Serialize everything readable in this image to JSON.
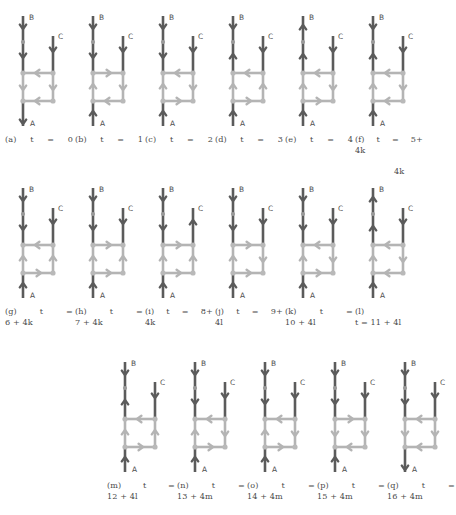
{
  "figure": {
    "colors": {
      "dark_edge": "#5b5b5b",
      "light_edge": "#b4b4b4",
      "node": "#b9b9b9",
      "node_dark": "#9a9a9a",
      "text": "#4a4a4a",
      "background": "#ffffff"
    },
    "node_labels": {
      "a": "A",
      "b": "B",
      "c": "C"
    },
    "rows": [
      {
        "id": "row-1",
        "panels": [
          {
            "key": "a",
            "label": "(a)",
            "time": "t = 0",
            "caption_lines": [
              "(a) t = 0"
            ],
            "tail": "",
            "arrows": {
              "b_top": "down",
              "b_mid": "down",
              "c_top": "down",
              "rung_top": "left",
              "rail_left": "down",
              "rail_right": "down",
              "rung_bottom": "left",
              "a_bottom": "down"
            }
          },
          {
            "key": "b",
            "label": "(b)",
            "time": "t = 1",
            "caption_lines": [
              "(b) t = 1"
            ],
            "tail": "",
            "arrows": {
              "b_top": "down",
              "b_mid": "down",
              "c_top": "down",
              "rung_top": "right",
              "rail_left": "up",
              "rail_right": "down",
              "rung_bottom": "left",
              "a_bottom": "up"
            }
          },
          {
            "key": "c",
            "label": "(c)",
            "time": "t = 2",
            "caption_lines": [
              "(c) t = 2"
            ],
            "tail": "",
            "arrows": {
              "b_top": "down",
              "b_mid": "down",
              "c_top": "down",
              "rung_top": "left",
              "rail_left": "up",
              "rail_right": "down",
              "rung_bottom": "right",
              "a_bottom": "up"
            }
          },
          {
            "key": "d",
            "label": "(d)",
            "time": "t = 3",
            "caption_lines": [
              "(d) t = 3"
            ],
            "tail": "",
            "arrows": {
              "b_top": "down",
              "b_mid": "up",
              "c_top": "down",
              "rung_top": "left",
              "rail_left": "up",
              "rail_right": "up",
              "rung_bottom": "right",
              "a_bottom": "up"
            }
          },
          {
            "key": "e",
            "label": "(e)",
            "time": "t = 4",
            "caption_lines": [
              "(e) t = 4"
            ],
            "tail": "",
            "arrows": {
              "b_top": "up",
              "b_mid": "up",
              "c_top": "down",
              "rung_top": "left",
              "rail_left": "up",
              "rail_right": "down",
              "rung_bottom": "right",
              "a_bottom": "up"
            }
          },
          {
            "key": "f",
            "label": "(f)",
            "time": "t = 5+",
            "caption_lines": [
              "(f) t = 5+"
            ],
            "tail": "4k",
            "arrows": {
              "b_top": "down",
              "b_mid": "up",
              "c_top": "down",
              "rung_top": "left",
              "rail_left": "up",
              "rail_right": "down",
              "rung_bottom": "left",
              "a_bottom": "up"
            }
          }
        ]
      },
      {
        "id": "row-2",
        "panels": [
          {
            "key": "g",
            "label": "(g)",
            "time": "t =",
            "caption_lines": [
              "(g) t ="
            ],
            "tail": "6 + 4k",
            "arrows": {
              "b_top": "down",
              "b_mid": "down",
              "c_top": "down",
              "rung_top": "left",
              "rail_left": "up",
              "rail_right": "up",
              "rung_bottom": "right",
              "a_bottom": "up"
            }
          },
          {
            "key": "h",
            "label": "(h)",
            "time": "t =",
            "caption_lines": [
              "(h) t ="
            ],
            "tail": "7 + 4k",
            "arrows": {
              "b_top": "down",
              "b_mid": "down",
              "c_top": "down",
              "rung_top": "right",
              "rail_left": "up",
              "rail_right": "up",
              "rung_bottom": "right",
              "a_bottom": "up"
            }
          },
          {
            "key": "i",
            "label": "(i)",
            "time": "t = 8+",
            "caption_lines": [
              "(i) t = 8+"
            ],
            "tail": "4k",
            "arrows": {
              "b_top": "down",
              "b_mid": "down",
              "c_top": "up",
              "rung_top": "right",
              "rail_left": "up",
              "rail_right": "up",
              "rung_bottom": "right",
              "a_bottom": "up"
            }
          },
          {
            "key": "j",
            "label": "(j)",
            "time": "t = 9+",
            "caption_lines": [
              "(j) t = 9+"
            ],
            "tail": "4l",
            "arrows": {
              "b_top": "down",
              "b_mid": "down",
              "c_top": "down",
              "rung_top": "right",
              "rail_left": "up",
              "rail_right": "down",
              "rung_bottom": "right",
              "a_bottom": "up"
            }
          },
          {
            "key": "k",
            "label": "(k)",
            "time": "t =",
            "caption_lines": [
              "(k) t ="
            ],
            "tail": "10 + 4l",
            "arrows": {
              "b_top": "down",
              "b_mid": "down",
              "c_top": "down",
              "rung_top": "left",
              "rail_left": "up",
              "rail_right": "down",
              "rung_bottom": "right",
              "a_bottom": "up"
            }
          },
          {
            "key": "l",
            "label": "(l)",
            "time": "t = 11 + 4l",
            "caption_lines": [
              "(l)"
            ],
            "tail": "t = 11 + 4l",
            "arrows": {
              "b_top": "up",
              "b_mid": "up",
              "c_top": "down",
              "rung_top": "left",
              "rail_left": "up",
              "rail_right": "down",
              "rung_bottom": "left",
              "a_bottom": "up"
            }
          }
        ]
      },
      {
        "id": "row-3",
        "panels": [
          {
            "key": "m",
            "label": "(m)",
            "time": "t =",
            "caption_lines": [
              "(m) t ="
            ],
            "tail": "12 + 4l",
            "arrows": {
              "b_top": "down",
              "b_mid": "up",
              "c_top": "down",
              "rung_top": "left",
              "rail_left": "up",
              "rail_right": "up",
              "rung_bottom": "right",
              "a_bottom": "up"
            }
          },
          {
            "key": "n",
            "label": "(n)",
            "time": "t =",
            "caption_lines": [
              "(n) t ="
            ],
            "tail": "13 + 4m",
            "arrows": {
              "b_top": "down",
              "b_mid": "down",
              "c_top": "down",
              "rung_top": "left",
              "rail_left": "up",
              "rail_right": "down",
              "rung_bottom": "right",
              "a_bottom": "up"
            }
          },
          {
            "key": "o",
            "label": "(o)",
            "time": "t =",
            "caption_lines": [
              "(o) t ="
            ],
            "tail": "14 + 4m",
            "arrows": {
              "b_top": "down",
              "b_mid": "down",
              "c_top": "down",
              "rung_top": "left",
              "rail_left": "up",
              "rail_right": "down",
              "rung_bottom": "right",
              "a_bottom": "up"
            }
          },
          {
            "key": "p",
            "label": "(p)",
            "time": "t =",
            "caption_lines": [
              "(p) t ="
            ],
            "tail": "15 + 4m",
            "arrows": {
              "b_top": "down",
              "b_mid": "down",
              "c_top": "down",
              "rung_top": "right",
              "rail_left": "down",
              "rail_right": "down",
              "rung_bottom": "left",
              "a_bottom": "up"
            }
          },
          {
            "key": "q",
            "label": "(q)",
            "time": "t =",
            "caption_lines": [
              "(q) t ="
            ],
            "tail": "16 + 4m",
            "arrows": {
              "b_top": "down",
              "b_mid": "down",
              "c_top": "down",
              "rung_top": "left",
              "rail_left": "down",
              "rail_right": "down",
              "rung_bottom": "left",
              "a_bottom": "down"
            }
          }
        ]
      }
    ],
    "overflow_tail": {
      "text": "4k",
      "left": 394,
      "top": 166
    }
  }
}
